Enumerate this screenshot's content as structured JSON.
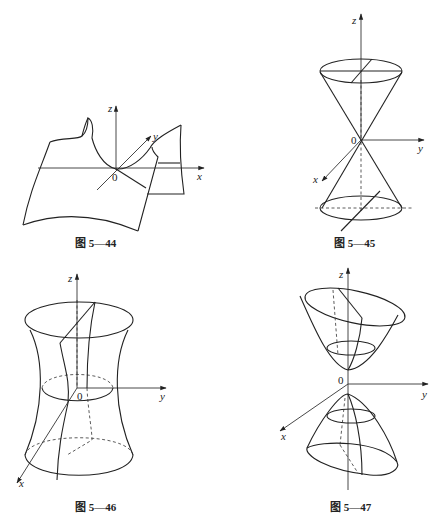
{
  "figures": [
    {
      "id": "fig-5-44",
      "caption": "图 5—44",
      "surface": "hyperbolic-paraboloid (saddle)",
      "axes": {
        "x": "x",
        "y": "y",
        "z": "z",
        "origin": "0"
      }
    },
    {
      "id": "fig-5-45",
      "caption": "图 5—45",
      "surface": "elliptic cone",
      "axes": {
        "x": "x",
        "y": "y",
        "z": "z",
        "origin": "0"
      }
    },
    {
      "id": "fig-5-46",
      "caption": "图 5—46",
      "surface": "hyperboloid of one sheet",
      "axes": {
        "x": "x",
        "y": "y",
        "z": "z",
        "origin": "0"
      }
    },
    {
      "id": "fig-5-47",
      "caption": "图 5—47",
      "surface": "hyperboloid of two sheets",
      "axes": {
        "x": "x",
        "y": "y",
        "z": "z",
        "origin": "0"
      }
    }
  ]
}
